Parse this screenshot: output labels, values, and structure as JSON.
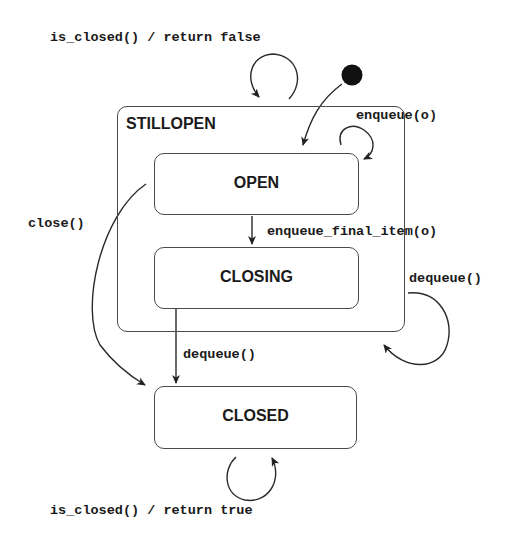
{
  "diagram": {
    "type": "UML state machine",
    "initial_state_marker": "filled-circle",
    "composite_state": {
      "name": "STILLOPEN",
      "substates": [
        "OPEN",
        "CLOSING"
      ]
    },
    "states": {
      "open": "OPEN",
      "closing": "CLOSING",
      "closed": "CLOSED"
    },
    "transitions": {
      "initial_to_open": {
        "from": "initial",
        "to": "OPEN",
        "label": ""
      },
      "stillopen_self": {
        "from": "STILLOPEN",
        "to": "STILLOPEN",
        "label": "is_closed() / return false"
      },
      "open_self": {
        "from": "OPEN",
        "to": "OPEN",
        "label": "enqueue(o)"
      },
      "open_to_closing": {
        "from": "OPEN",
        "to": "CLOSING",
        "label": "enqueue_final_item(o)"
      },
      "stillopen_dequeue_self": {
        "from": "STILLOPEN",
        "to": "STILLOPEN",
        "label": "dequeue()"
      },
      "open_to_closed": {
        "from": "OPEN",
        "to": "CLOSED",
        "label": "close()"
      },
      "closing_to_closed": {
        "from": "CLOSING",
        "to": "CLOSED",
        "label": "dequeue()"
      },
      "closed_self": {
        "from": "CLOSED",
        "to": "CLOSED",
        "label": "is_closed() / return true"
      }
    }
  }
}
